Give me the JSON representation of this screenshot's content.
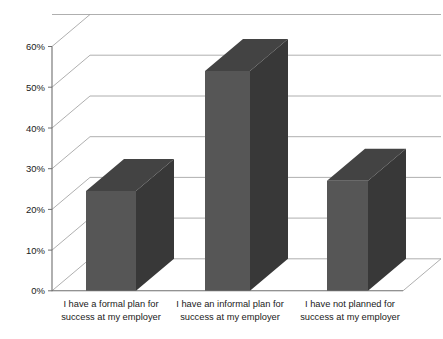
{
  "chart_data": {
    "type": "bar",
    "title": "",
    "subtitle": "",
    "xlabel": "",
    "ylabel": "",
    "categories": [
      "I have a formal plan for success at my employer",
      "I have an informal plan for success at my employer",
      "I have not planned for success at my employer"
    ],
    "category_lines": [
      [
        "I have a formal plan for",
        "success at my employer"
      ],
      [
        "I have an informal plan for",
        "success at my employer"
      ],
      [
        "I have not planned for",
        "success at my employer"
      ]
    ],
    "values": [
      24.5,
      54,
      27
    ],
    "value_labels": [
      "24.5%",
      "54%",
      "27%"
    ],
    "ylim": [
      0,
      60
    ],
    "ytick_values": [
      0,
      10,
      20,
      30,
      40,
      50,
      60
    ],
    "ytick_labels": [
      "0%",
      "10%",
      "20%",
      "30%",
      "40%",
      "50%",
      "60%"
    ],
    "grid": true,
    "legend": false,
    "legend_position": "none",
    "three_d": true,
    "colors": {
      "bar_front": "#565656",
      "bar_side": "#383838",
      "bar_top": "#434343",
      "gridline": "#9a9a9a",
      "axis": "#6e6e6e",
      "text": "#1a1a1a",
      "background": "#ffffff"
    }
  },
  "axis": {
    "y_ticks": [
      {
        "label": "60%"
      },
      {
        "label": "50%"
      },
      {
        "label": "40%"
      },
      {
        "label": "30%"
      },
      {
        "label": "20%"
      },
      {
        "label": "10%"
      },
      {
        "label": "0%"
      }
    ]
  },
  "categories": [
    {
      "line1": "I have a formal plan for",
      "line2": "success at my employer"
    },
    {
      "line1": "I have an informal plan for",
      "line2": "success at my employer"
    },
    {
      "line1": "I have not planned for",
      "line2": "success at my employer"
    }
  ]
}
